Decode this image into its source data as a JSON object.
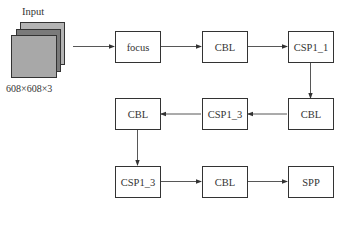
{
  "input": {
    "title": "Input",
    "size": "608×608×3",
    "layer_colors": [
      "#b4b4b4",
      "#7a7a7a",
      "#a8a8a8"
    ]
  },
  "nodes": [
    {
      "id": "focus",
      "label": "focus"
    },
    {
      "id": "cbl1",
      "label": "CBL"
    },
    {
      "id": "csp1_1",
      "label": "CSP1_1"
    },
    {
      "id": "cbl2",
      "label": "CBL"
    },
    {
      "id": "csp1_3a",
      "label": "CSP1_3"
    },
    {
      "id": "cbl3",
      "label": "CBL"
    },
    {
      "id": "csp1_3b",
      "label": "CSP1_3"
    },
    {
      "id": "cbl4",
      "label": "CBL"
    },
    {
      "id": "spp",
      "label": "SPP"
    }
  ],
  "edges": [
    [
      "input",
      "focus"
    ],
    [
      "focus",
      "cbl1"
    ],
    [
      "cbl1",
      "csp1_1"
    ],
    [
      "csp1_1",
      "cbl2"
    ],
    [
      "cbl2",
      "csp1_3a"
    ],
    [
      "csp1_3a",
      "cbl3"
    ],
    [
      "cbl3",
      "csp1_3b"
    ],
    [
      "csp1_3b",
      "cbl4"
    ],
    [
      "cbl4",
      "spp"
    ]
  ]
}
